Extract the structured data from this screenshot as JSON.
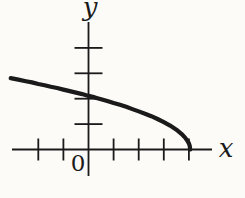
{
  "figure": {
    "paper_color": "#fcfbf8",
    "ink_color": "#1a1a1a",
    "axis_labels": {
      "x": "x",
      "y": "y"
    },
    "origin_label": "0"
  },
  "chart_data": {
    "type": "line",
    "title": "",
    "xlabel": "x",
    "ylabel": "y",
    "xlim": [
      -3.2,
      5.0
    ],
    "ylim": [
      -1.1,
      5.1
    ],
    "x_ticks": [
      -2,
      -1,
      1,
      2,
      3,
      4
    ],
    "y_ticks": [
      1,
      2,
      3,
      4
    ],
    "grid": false,
    "legend": false,
    "series": [
      {
        "name": "curve",
        "description": "Thick hand-drawn decreasing concave-down curve resembling y = sqrt(4 - x): enters at upper left near (-3.1, 2.8), crosses the y-axis near y = 2.1, and descends to meet the x-axis with a vertical tangent near x = 4",
        "x": [
          -3.1,
          -2.75,
          -2.5,
          -2.25,
          -2.0,
          -1.75,
          -1.5,
          -1.25,
          -1.0,
          -0.75,
          -0.5,
          -0.25,
          0.0,
          0.25,
          0.5,
          0.75,
          1.0,
          1.25,
          1.5,
          1.75,
          2.0,
          2.25,
          2.5,
          2.75,
          3.0,
          3.25,
          3.5,
          3.7,
          3.85,
          3.95,
          4.0,
          4.03,
          4.05
        ],
        "y": [
          2.81,
          2.74,
          2.69,
          2.64,
          2.58,
          2.53,
          2.47,
          2.42,
          2.36,
          2.3,
          2.24,
          2.18,
          2.11,
          2.05,
          1.98,
          1.91,
          1.83,
          1.76,
          1.68,
          1.59,
          1.5,
          1.41,
          1.31,
          1.2,
          1.08,
          0.94,
          0.78,
          0.62,
          0.47,
          0.33,
          0.24,
          0.15,
          0.0
        ]
      }
    ]
  }
}
